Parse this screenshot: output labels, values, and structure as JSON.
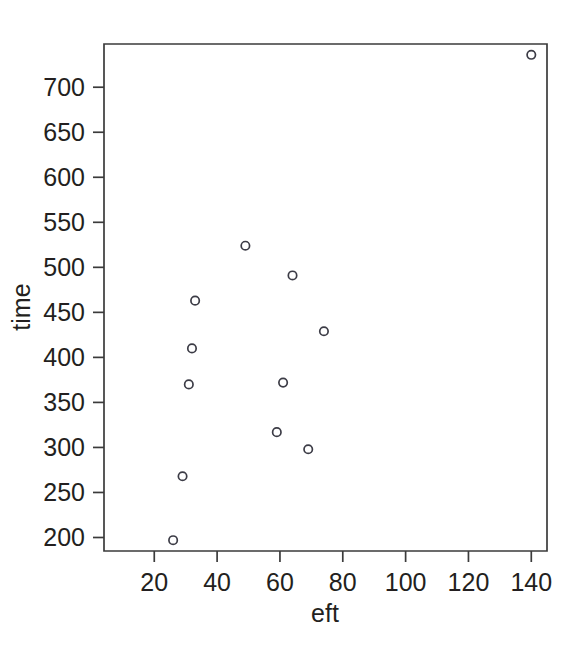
{
  "chart_data": {
    "type": "scatter",
    "title": "",
    "xlabel": "eft",
    "ylabel": "time",
    "xlim": [
      4,
      145
    ],
    "ylim": [
      185,
      748
    ],
    "grid": false,
    "legend": null,
    "xticks": [
      20,
      40,
      60,
      80,
      100,
      120,
      140
    ],
    "xtick_labels": [
      "20",
      "40",
      "60",
      "80",
      "100",
      "120",
      "140"
    ],
    "yticks": [
      200,
      250,
      300,
      350,
      400,
      450,
      500,
      550,
      600,
      650,
      700
    ],
    "ytick_labels": [
      "200",
      "250",
      "300",
      "350",
      "400",
      "450",
      "500",
      "550",
      "600",
      "650",
      "700"
    ],
    "marker": "open-circle",
    "marker_color": "#3c3c46",
    "points": [
      {
        "x": 26,
        "y": 197
      },
      {
        "x": 29,
        "y": 268
      },
      {
        "x": 31,
        "y": 370
      },
      {
        "x": 32,
        "y": 410
      },
      {
        "x": 33,
        "y": 463
      },
      {
        "x": 49,
        "y": 524
      },
      {
        "x": 59,
        "y": 317
      },
      {
        "x": 61,
        "y": 372
      },
      {
        "x": 64,
        "y": 491
      },
      {
        "x": 69,
        "y": 298
      },
      {
        "x": 74,
        "y": 429
      },
      {
        "x": 140,
        "y": 736
      }
    ]
  },
  "axes": {
    "x_axis_name": "eft",
    "y_axis_name": "time"
  },
  "colors": {
    "axis": "#3b3b3b",
    "text": "#231f20",
    "marker": "#3c3c46",
    "background": "#ffffff"
  }
}
